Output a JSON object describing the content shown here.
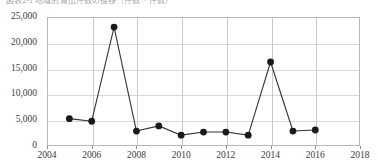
{
  "chart_title": "図表2-1 地域別貸出件数の推移（件数・件数）",
  "axis": {
    "y_ticks": [
      "0",
      "5,000",
      "10,000",
      "15,000",
      "20,000",
      "25,000"
    ],
    "x_ticks": [
      "2004",
      "2006",
      "2008",
      "2010",
      "2012",
      "2014",
      "2016",
      "2018"
    ]
  },
  "colors": {
    "line": "#333333",
    "marker": "#1a1a1a",
    "grid": "#d8d8d8",
    "grid_vertical": "#c9c9c9",
    "frame": "#b9b9b9",
    "text": "#3a3a3a"
  },
  "chart_data": {
    "type": "line",
    "title": "図表2-1 地域別貸出件数の推移（件数・件数）",
    "xlabel": "",
    "ylabel": "",
    "xlim": [
      2004,
      2018
    ],
    "ylim": [
      0,
      25000
    ],
    "ytick_interval": 5000,
    "xtick_interval": 2,
    "grid": true,
    "legend": false,
    "marker": "circle",
    "x": [
      2005,
      2006,
      2007,
      2008,
      2009,
      2010,
      2011,
      2012,
      2013,
      2014,
      2015,
      2016
    ],
    "values": [
      5300,
      4800,
      23050,
      2900,
      3900,
      2100,
      2700,
      2700,
      2100,
      16280,
      2900,
      3100
    ],
    "series": [
      {
        "name": "件数",
        "values": [
          5300,
          4800,
          23050,
          2900,
          3900,
          2100,
          2700,
          2700,
          2100,
          16280,
          2900,
          3100
        ]
      }
    ]
  }
}
